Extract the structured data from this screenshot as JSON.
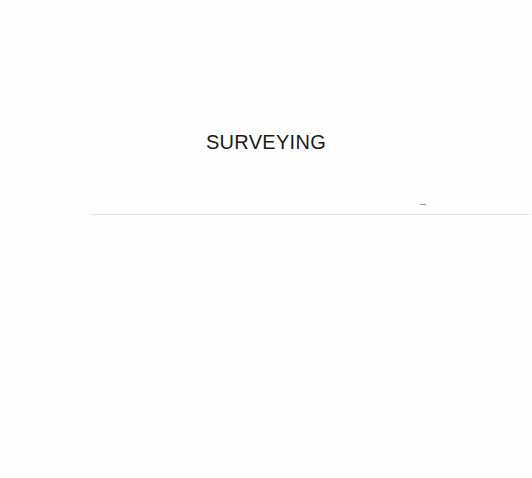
{
  "page": {
    "heading": "SURVEYING"
  }
}
